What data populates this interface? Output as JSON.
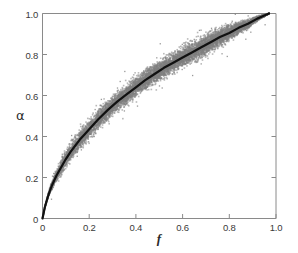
{
  "chart_data": {
    "type": "scatter",
    "title": "",
    "subtitle": "",
    "xlabel": "f",
    "ylabel": "α",
    "xlim": [
      0,
      1.0
    ],
    "ylim": [
      0,
      1.0
    ],
    "grid": false,
    "legend": null,
    "legend_position": "none",
    "xticks": [
      0,
      0.2,
      0.4,
      0.6,
      0.8,
      1.0
    ],
    "xtick_labels": [
      "0",
      "0.2",
      "0.4",
      "0.6",
      "0.8",
      "1.0"
    ],
    "yticks": [
      0,
      0.2,
      0.4,
      0.6,
      0.8,
      1.0
    ],
    "ytick_labels": [
      "0",
      "0.2",
      "0.4",
      "0.6",
      "0.8",
      "1.0"
    ],
    "colors": {
      "scatter": "#7f7f7f",
      "curve": "#111111",
      "axis": "#8a8a8a",
      "text": "#333333",
      "background": "#ffffff"
    },
    "series": [
      {
        "name": "scatter-cloud",
        "type": "scatter",
        "color": "#7f7f7f",
        "marker": "square",
        "marker_size": 1.6,
        "x_range": [
          0.0,
          0.97
        ],
        "band_halfwidth": 0.035,
        "comment": "dense gray point cloud straddling the fitted curve, widest near f=0.4-0.6, narrowing at both ends"
      },
      {
        "name": "fitted-curve",
        "type": "line",
        "color": "#111111",
        "line_width": 2.2,
        "x": [
          0.0,
          0.01,
          0.02,
          0.03,
          0.04,
          0.05,
          0.06,
          0.08,
          0.1,
          0.12,
          0.14,
          0.16,
          0.18,
          0.2,
          0.24,
          0.28,
          0.32,
          0.36,
          0.4,
          0.44,
          0.48,
          0.52,
          0.56,
          0.6,
          0.64,
          0.68,
          0.72,
          0.76,
          0.8,
          0.84,
          0.88,
          0.92,
          0.95,
          0.97
        ],
        "y": [
          0.0,
          0.055,
          0.095,
          0.13,
          0.16,
          0.185,
          0.21,
          0.25,
          0.29,
          0.325,
          0.355,
          0.385,
          0.41,
          0.435,
          0.485,
          0.53,
          0.57,
          0.605,
          0.64,
          0.675,
          0.705,
          0.735,
          0.76,
          0.785,
          0.81,
          0.835,
          0.86,
          0.885,
          0.905,
          0.93,
          0.95,
          0.975,
          0.99,
          1.0
        ]
      }
    ]
  },
  "axes": {
    "x_title": "f",
    "y_title": "α"
  }
}
